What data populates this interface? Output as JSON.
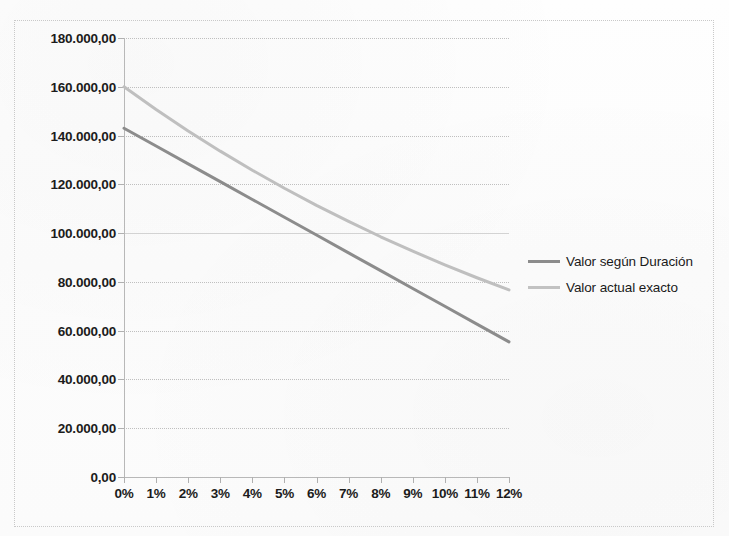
{
  "chart_data": {
    "type": "line",
    "title": "",
    "subtitle": "",
    "xlabel": "",
    "ylabel": "",
    "xlim": [
      0,
      12
    ],
    "ylim": [
      0,
      180000
    ],
    "grid": true,
    "legend_position": "right",
    "x": [
      0,
      1,
      2,
      3,
      4,
      5,
      6,
      7,
      8,
      9,
      10,
      11,
      12
    ],
    "x_tick_labels": [
      "0%",
      "1%",
      "2%",
      "3%",
      "4%",
      "5%",
      "6%",
      "7%",
      "8%",
      "9%",
      "10%",
      "11%",
      "12%"
    ],
    "y_tick_labels": [
      "0,00",
      "20.000,00",
      "40.000,00",
      "60.000,00",
      "80.000,00",
      "100.000,00",
      "120.000,00",
      "140.000,00",
      "160.000,00",
      "180.000,00"
    ],
    "y_tick_values": [
      0,
      20000,
      40000,
      60000,
      80000,
      100000,
      120000,
      140000,
      160000,
      180000
    ],
    "series": [
      {
        "name": "Valor según Duración",
        "color": "#8c8c8c",
        "values": [
          143000,
          135700,
          128400,
          121100,
          113800,
          106500,
          99200,
          91900,
          84600,
          77300,
          70000,
          62700,
          55400
        ]
      },
      {
        "name": "Valor actual exacto",
        "color": "#bfbfbf",
        "values": [
          160000,
          150700,
          141900,
          133600,
          125800,
          118400,
          111400,
          104800,
          98500,
          92600,
          87000,
          81700,
          76700
        ]
      }
    ]
  },
  "legend": {
    "items": [
      {
        "label": "Valor según Duración",
        "color": "#8c8c8c"
      },
      {
        "label": "Valor actual exacto",
        "color": "#c2c2c2"
      }
    ]
  },
  "axes": {
    "y_labels": [
      "180.000,00",
      "160.000,00",
      "140.000,00",
      "120.000,00",
      "100.000,00",
      "80.000,00",
      "60.000,00",
      "40.000,00",
      "20.000,00",
      "0,00"
    ],
    "x_labels": [
      "0%",
      "1%",
      "2%",
      "3%",
      "4%",
      "5%",
      "6%",
      "7%",
      "8%",
      "9%",
      "10%",
      "11%",
      "12%"
    ]
  }
}
